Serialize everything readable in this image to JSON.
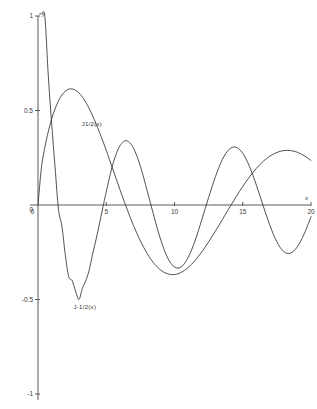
{
  "chart_data": {
    "type": "line",
    "title": "",
    "subtitle": "",
    "xlabel": "x",
    "ylabel": "y",
    "xlim": [
      0,
      20
    ],
    "ylim": [
      -1,
      1
    ],
    "grid": false,
    "legend_position": "inline-annotation",
    "x_ticks": [
      0,
      5,
      10,
      15,
      20
    ],
    "x_tick_labels": [
      "0",
      "5",
      "10",
      "15",
      "20"
    ],
    "y_ticks": [
      -1,
      -0.5,
      0,
      0.5,
      1
    ],
    "y_tick_labels": [
      "-1",
      "-0.5",
      "0",
      "0.5",
      "1"
    ],
    "annotations": [
      {
        "text": "J1/2(x)",
        "x": 3.2,
        "y": 0.42
      },
      {
        "text": "J-1/2(x)",
        "x": 2.6,
        "y": -0.55
      }
    ],
    "series": [
      {
        "name": "J1/2(x)",
        "label": "J1/2(x)",
        "color": "#3d3d3d",
        "formula": "sqrt(2/(pi*x))*sin(x)",
        "x": [
          0.0,
          0.25,
          0.5,
          0.75,
          1.0,
          1.25,
          1.5,
          1.75,
          2.0,
          2.25,
          2.5,
          2.75,
          3.0,
          3.25,
          3.5,
          3.75,
          4.0,
          4.25,
          4.5,
          4.75,
          5.0,
          5.5,
          6.0,
          6.5,
          7.0,
          7.5,
          8.0,
          8.5,
          9.0,
          9.5,
          10.0,
          10.5,
          11.0,
          11.5,
          12.0,
          12.5,
          13.0,
          13.5,
          14.0,
          14.5,
          15.0,
          15.5,
          16.0,
          16.5,
          17.0,
          17.5,
          18.0,
          18.5,
          19.0,
          19.5,
          20.0
        ],
        "y": [
          0.0,
          0.197,
          0.305,
          0.387,
          0.455,
          0.509,
          0.551,
          0.582,
          0.602,
          0.613,
          0.614,
          0.607,
          0.593,
          0.571,
          0.543,
          0.51,
          0.472,
          0.43,
          0.386,
          0.338,
          0.289,
          0.186,
          0.082,
          -0.017,
          -0.109,
          -0.19,
          -0.257,
          -0.309,
          -0.345,
          -0.364,
          -0.368,
          -0.356,
          -0.331,
          -0.294,
          -0.248,
          -0.195,
          -0.138,
          -0.078,
          -0.017,
          0.042,
          0.098,
          0.149,
          0.194,
          0.231,
          0.259,
          0.278,
          0.288,
          0.288,
          0.279,
          0.261,
          0.236
        ]
      },
      {
        "name": "J-1/2(x)",
        "label": "J-1/2(x)",
        "color": "#3d3d3d",
        "formula": "sqrt(2/(pi*x))*cos(x)",
        "x": [
          0.12,
          0.25,
          0.5,
          0.75,
          1.0,
          1.25,
          1.5,
          1.75,
          2.0,
          2.25,
          2.5,
          2.75,
          3.0,
          3.25,
          3.5,
          3.75,
          4.0,
          4.25,
          4.5,
          4.75,
          5.0,
          5.5,
          6.0,
          6.5,
          7.0,
          7.5,
          8.0,
          8.5,
          9.0,
          9.5,
          10.0,
          10.5,
          11.0,
          11.5,
          12.0,
          12.5,
          13.0,
          13.5,
          14.0,
          14.5,
          15.0,
          15.5,
          16.0,
          16.5,
          17.0,
          17.5,
          18.0,
          18.5,
          19.0,
          19.5,
          20.0
        ],
        "y": [
          2.29,
          1.545,
          0.997,
          0.688,
          0.431,
          0.201,
          -0.023,
          -0.111,
          -0.264,
          -0.379,
          -0.4,
          -0.455,
          -0.5,
          -0.442,
          -0.4,
          -0.345,
          -0.26,
          -0.183,
          -0.1,
          -0.014,
          0.07,
          0.22,
          0.313,
          0.34,
          0.3,
          0.205,
          0.075,
          -0.061,
          -0.186,
          -0.28,
          -0.328,
          -0.327,
          -0.278,
          -0.19,
          -0.078,
          0.04,
          0.15,
          0.24,
          0.294,
          0.306,
          0.274,
          0.203,
          0.105,
          -0.005,
          -0.11,
          -0.195,
          -0.246,
          -0.255,
          -0.221,
          -0.153,
          -0.062
        ]
      }
    ]
  },
  "axes": {
    "y_axis_name": "y",
    "x_axis_name": "x"
  }
}
